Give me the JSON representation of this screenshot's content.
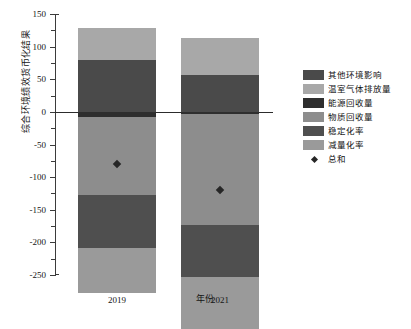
{
  "chart_data": {
    "type": "bar",
    "subtype": "stacked-bar-with-total-marker",
    "title": "",
    "xlabel": "年份",
    "ylabel": "综合环境绩效货币化结果",
    "categories": [
      "2019",
      "2021"
    ],
    "ylim": [
      -250,
      150
    ],
    "yticks": [
      150,
      100,
      50,
      0,
      -50,
      -100,
      -150,
      -200,
      -250
    ],
    "ytick_labels": [
      "150",
      "100",
      "50",
      "0",
      "-50",
      "-100",
      "-150",
      "-200",
      "-250"
    ],
    "minor_tick_step": 25,
    "grid": false,
    "legend_position": "right",
    "series": [
      {
        "name": "其他环境影响",
        "color": "#4a4a4a",
        "values": [
          80,
          56
        ]
      },
      {
        "name": "温室气体排放量",
        "color": "#a8a8a8",
        "values": [
          48,
          57
        ]
      },
      {
        "name": "能源回收量",
        "color": "#2e2e2e",
        "values": [
          -8,
          -3
        ]
      },
      {
        "name": "物质回收量",
        "color": "#8d8d8d",
        "values": [
          -120,
          -170
        ]
      },
      {
        "name": "稳定化率",
        "color": "#4f4f4f",
        "values": [
          -80,
          -80
        ]
      },
      {
        "name": "减量化率",
        "color": "#9a9a9a",
        "values": [
          -70,
          -80
        ]
      }
    ],
    "total_marker": {
      "name": "总和",
      "color": "#262626",
      "marker": "diamond",
      "values": [
        -80,
        -120
      ]
    },
    "annotations": []
  },
  "legend": {
    "entries": [
      {
        "label": "其他环境影响"
      },
      {
        "label": "温室气体排放量"
      },
      {
        "label": "能源回收量"
      },
      {
        "label": "物质回收量"
      },
      {
        "label": "稳定化率"
      },
      {
        "label": "减量化率"
      },
      {
        "label": "总和"
      }
    ]
  }
}
